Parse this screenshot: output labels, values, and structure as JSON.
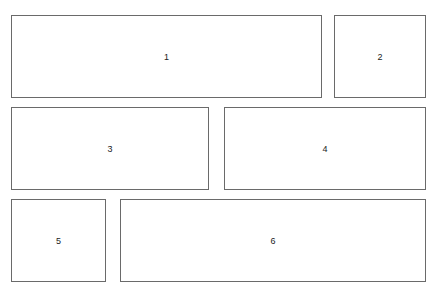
{
  "diagram": {
    "type": "panel-layout",
    "panels": [
      {
        "label": "1",
        "x": 11,
        "y": 15,
        "w": 311,
        "h": 82
      },
      {
        "label": "2",
        "x": 334,
        "y": 15,
        "w": 92,
        "h": 82
      },
      {
        "label": "3",
        "x": 11,
        "y": 107,
        "w": 198,
        "h": 82
      },
      {
        "label": "4",
        "x": 224,
        "y": 107,
        "w": 202,
        "h": 82
      },
      {
        "label": "5",
        "x": 11,
        "y": 199,
        "w": 95,
        "h": 82
      },
      {
        "label": "6",
        "x": 120,
        "y": 199,
        "w": 306,
        "h": 82
      }
    ]
  }
}
